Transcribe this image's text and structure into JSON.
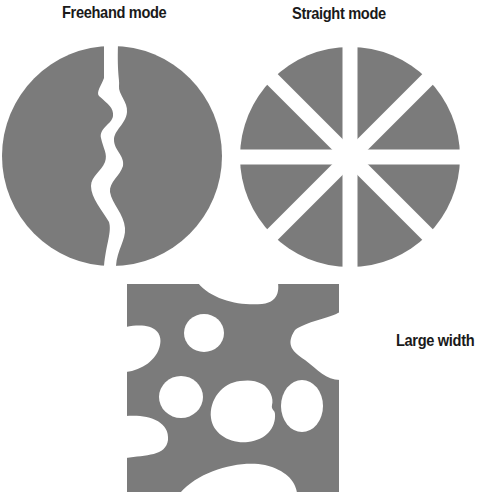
{
  "labels": {
    "freehand": "Freehand mode",
    "straight": "Straight mode",
    "large_width": "Large width"
  },
  "colors": {
    "fill": "#7b7b7b",
    "background": "#ffffff",
    "text": "#1a1a1a"
  },
  "figures": [
    {
      "name": "freehand-circle",
      "description": "Gray circle split by one wavy white freehand cut"
    },
    {
      "name": "straight-circle",
      "description": "Gray circle split into 8 wedges by 4 straight white cuts"
    },
    {
      "name": "large-width-square",
      "description": "Gray square with large-width eraser holes"
    }
  ]
}
